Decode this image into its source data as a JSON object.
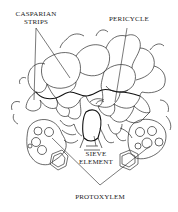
{
  "figure": {
    "style": "black ink line drawing on white",
    "colors": {
      "ink": "#222222",
      "background": "#ffffff"
    }
  },
  "labels": {
    "casparian_line1": "CASPARIAN",
    "casparian_line2": "STRIPS",
    "pericycle": "PERICYCLE",
    "sieve_line1": "SIEVE",
    "sieve_line2": "ELEMENT",
    "protoxylem": "PROTOXYLEM"
  }
}
